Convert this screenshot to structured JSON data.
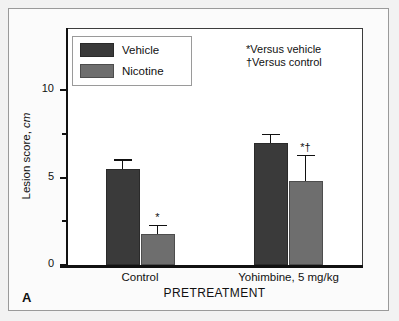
{
  "panel": {
    "letter": "A"
  },
  "legend": {
    "items": [
      {
        "label": "Vehicle",
        "color": "#3a3a3a"
      },
      {
        "label": "Nicotine",
        "color": "#6e6e6e"
      }
    ]
  },
  "notes": [
    "*Versus vehicle",
    "†Versus control"
  ],
  "axes": {
    "y_label_main": "Lesion score,",
    "y_label_unit": "cm",
    "x_title": "PRETREATMENT",
    "y_ticks": [
      "0",
      "5",
      "10"
    ]
  },
  "chart_data": {
    "type": "bar",
    "title": "",
    "xlabel": "PRETREATMENT",
    "ylabel": "Lesion score, cm",
    "ylim": [
      0,
      11.5
    ],
    "ytick_values": [
      0,
      2.5,
      5,
      7.5,
      10
    ],
    "ytick_labels": [
      "0",
      "",
      "5",
      "",
      "10"
    ],
    "grid": false,
    "legend_position": "upper-left",
    "categories": [
      "Control",
      "Yohimbine, 5 mg/kg"
    ],
    "series": [
      {
        "name": "Vehicle",
        "color": "#3a3a3a",
        "values": [
          5.5,
          7.0
        ],
        "errors": [
          0.55,
          0.5
        ],
        "annotations": [
          "",
          ""
        ]
      },
      {
        "name": "Nicotine",
        "color": "#6e6e6e",
        "values": [
          1.8,
          4.8
        ],
        "errors": [
          0.5,
          1.5
        ],
        "annotations": [
          "*",
          "*†"
        ]
      }
    ],
    "annotations_text": [
      "*Versus vehicle",
      "†Versus control"
    ]
  }
}
